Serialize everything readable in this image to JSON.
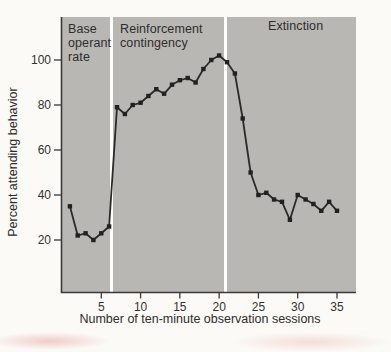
{
  "colors": {
    "page_bg": "#fbfaf7",
    "plot_bg": "#b9b7b4",
    "line": "#2b2a29",
    "marker": "#222120",
    "axis": "#3a3938",
    "tick_text": "#333231",
    "phase_divider": "#fdfdfb"
  },
  "chart_data": {
    "type": "line",
    "title": "",
    "xlabel": "Number of ten-minute observation sessions",
    "ylabel": "Percent attending behavior",
    "x_ticks": [
      5,
      10,
      15,
      20,
      25,
      30,
      35
    ],
    "y_ticks": [
      20,
      40,
      60,
      80,
      100
    ],
    "xlim": [
      0,
      37.4
    ],
    "ylim": [
      0,
      110
    ],
    "grid": "off",
    "legend": "none",
    "marker_shape": "square",
    "phases": [
      {
        "label": "Base operant rate",
        "sessions": "1-6"
      },
      {
        "label": "Reinforcement contingency",
        "sessions": "7-20"
      },
      {
        "label": "Extinction",
        "sessions": "21-35"
      }
    ],
    "phase_divider_positions_sessions": [
      6.3,
      20.8
    ],
    "series": [
      {
        "name": "attending behavior",
        "x": [
          1,
          2,
          3,
          4,
          5,
          6,
          7,
          8,
          9,
          10,
          11,
          12,
          13,
          14,
          15,
          16,
          17,
          18,
          19,
          20,
          21,
          22,
          23,
          24,
          25,
          26,
          27,
          28,
          29,
          30,
          31,
          32,
          33,
          34,
          35
        ],
        "y": [
          35,
          22,
          23,
          20,
          23,
          26,
          79,
          76,
          80,
          81,
          84,
          87,
          85,
          89,
          91,
          92,
          90,
          96,
          100,
          102,
          99,
          94,
          74,
          50,
          40,
          41,
          38,
          37,
          29,
          40,
          38,
          36,
          33,
          37,
          33
        ]
      }
    ]
  }
}
